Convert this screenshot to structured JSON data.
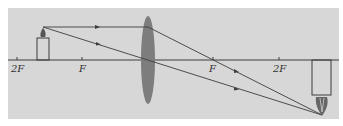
{
  "diagram": {
    "type": "converging-lens ray diagram",
    "colors": {
      "background": "#d7d7d7",
      "lens": "#7d7d7d",
      "lines": "#3c3c3c"
    },
    "axis_labels": [
      {
        "text": "2F",
        "x": 17
      },
      {
        "text": "F",
        "x": 82
      },
      {
        "text": "F",
        "x": 213
      },
      {
        "text": "2F",
        "x": 279
      }
    ]
  }
}
